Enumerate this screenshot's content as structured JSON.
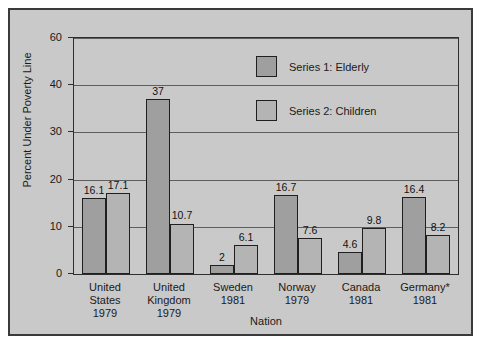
{
  "chart_data": {
    "type": "bar",
    "title": "",
    "xlabel": "Nation",
    "ylabel": "Percent Under Poverty Line",
    "categories": [
      "United States 1979",
      "United Kingdom 1979",
      "Sweden 1981",
      "Norway 1979",
      "Canada 1981",
      "Germany* 1981"
    ],
    "category_lines": [
      [
        "United",
        "States",
        "1979"
      ],
      [
        "United",
        "Kingdom",
        "1979"
      ],
      [
        "Sweden",
        "1981"
      ],
      [
        "Norway",
        "1979"
      ],
      [
        "Canada",
        "1981"
      ],
      [
        "Germany*",
        "1981"
      ]
    ],
    "series": [
      {
        "name": "Series 1: Elderly",
        "values": [
          16.1,
          37,
          2,
          16.7,
          4.6,
          16.4
        ],
        "labels": [
          "16.1",
          "37",
          "2",
          "16.7",
          "4.6",
          "16.4"
        ]
      },
      {
        "name": "Series 2: Children",
        "values": [
          17.1,
          10.7,
          6.1,
          7.6,
          9.8,
          8.2
        ],
        "labels": [
          "17.1",
          "10.7",
          "6.1",
          "7.6",
          "9.8",
          "8.2"
        ]
      }
    ],
    "yticks": [
      0,
      10,
      20,
      30,
      40,
      60
    ],
    "ytick_labels": [
      "0",
      "10",
      "20",
      "30",
      "40",
      "60"
    ],
    "ylim": [
      0,
      60
    ],
    "grid": true,
    "legend_position": "upper-center"
  },
  "legend": {
    "entries": [
      {
        "label": "Series 1: Elderly"
      },
      {
        "label": "Series 2: Children"
      }
    ]
  },
  "colors": {
    "series1": "#9f9f9f",
    "series2": "#b4b4b4",
    "background": "#c9c9c9",
    "frame": "#3a3a3a",
    "gridline": "#5e5e5e",
    "text": "#1a1a1a"
  }
}
